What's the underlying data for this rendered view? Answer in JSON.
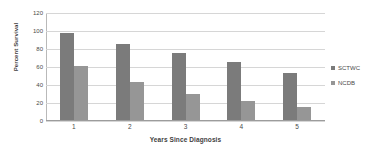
{
  "chart_data": {
    "type": "bar",
    "title": "",
    "subtitle": "",
    "xlabel": "Years Since Diagnosis",
    "ylabel": "Percent Survival",
    "categories": [
      "1",
      "2",
      "3",
      "4",
      "5"
    ],
    "series": [
      {
        "name": "SCTWC",
        "values": [
          97,
          84,
          74,
          64,
          52
        ],
        "color": "#7b7b7b"
      },
      {
        "name": "NCDB",
        "values": [
          60,
          42,
          29,
          21,
          14
        ],
        "color": "#969696"
      }
    ],
    "ylim": [
      0,
      120
    ],
    "yticks": [
      0,
      20,
      40,
      60,
      80,
      100,
      120
    ],
    "ytick_labels": [
      "0",
      "20",
      "40",
      "60",
      "80",
      "100",
      "120"
    ],
    "grid": "horizontal",
    "legend_position": "right",
    "background_color": "#ffffff",
    "gridline_color": "#d6d6d6",
    "axis_color": "#9c9c9c"
  }
}
